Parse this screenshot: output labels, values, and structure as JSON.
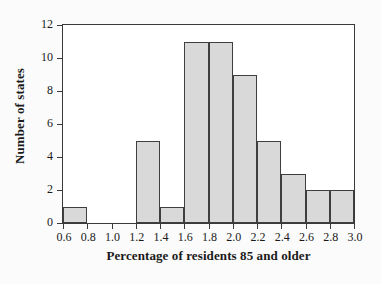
{
  "chart_data": {
    "type": "bar",
    "title": "",
    "xlabel": "Percentage of residents 85 and older",
    "ylabel": "Number of states",
    "xlim": [
      0.6,
      3.0
    ],
    "ylim": [
      0,
      12
    ],
    "grid": false,
    "legend": null,
    "bin_width": 0.2,
    "bin_edges": [
      0.6,
      0.8,
      1.0,
      1.2,
      1.4,
      1.6,
      1.8,
      2.0,
      2.2,
      2.4,
      2.6,
      2.8,
      3.0
    ],
    "categories": [
      "0.6-0.8",
      "0.8-1.0",
      "1.0-1.2",
      "1.2-1.4",
      "1.4-1.6",
      "1.6-1.8",
      "1.8-2.0",
      "2.0-2.2",
      "2.2-2.4",
      "2.4-2.6",
      "2.6-2.8",
      "2.8-3.0"
    ],
    "values": [
      1,
      0,
      0,
      5,
      1,
      11,
      11,
      9,
      5,
      3,
      2,
      2
    ],
    "xticks": [
      "0.6",
      "0.8",
      "1.0",
      "1.2",
      "1.4",
      "1.6",
      "1.8",
      "2.0",
      "2.2",
      "2.4",
      "2.6",
      "2.8",
      "3.0"
    ],
    "xtick_values": [
      0.6,
      0.8,
      1.0,
      1.2,
      1.4,
      1.6,
      1.8,
      2.0,
      2.2,
      2.4,
      2.6,
      2.8,
      3.0
    ],
    "yticks": [
      "0",
      "2",
      "4",
      "6",
      "8",
      "10",
      "12"
    ],
    "ytick_values": [
      0,
      2,
      4,
      6,
      8,
      10,
      12
    ],
    "bar_fill_color": "#d9d9d9",
    "bar_edge_color": "#3f3f3f",
    "axis_color": "#3a3a3a",
    "background_color": "#fbfbfb",
    "plot_background_color": "#ffffff"
  }
}
